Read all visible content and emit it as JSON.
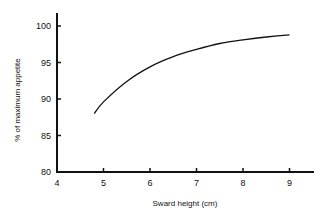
{
  "chart_data": {
    "type": "line",
    "title": "",
    "xlabel": "Sward height (cm)",
    "ylabel": "% of maximum appetite",
    "xlim": [
      4,
      9.5
    ],
    "ylim": [
      80,
      101.5
    ],
    "xticks": [
      4,
      5,
      6,
      7,
      8,
      9
    ],
    "yticks": [
      80,
      85,
      90,
      95,
      100
    ],
    "grid": false,
    "legend": null,
    "series": [
      {
        "name": "appetite",
        "x": [
          4.8,
          5.0,
          5.5,
          6.0,
          6.5,
          7.0,
          7.5,
          8.0,
          8.5,
          9.0
        ],
        "y": [
          88.0,
          89.6,
          92.4,
          94.4,
          95.8,
          96.8,
          97.6,
          98.1,
          98.5,
          98.8
        ]
      }
    ],
    "line_color": "#111111"
  }
}
